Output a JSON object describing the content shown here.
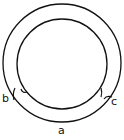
{
  "diagram": {
    "stroke_color": "#111111",
    "background": "#ffffff",
    "outer_circle": {
      "cx": 62,
      "cy": 63,
      "r": 59
    },
    "inner_circle": {
      "cx": 62,
      "cy": 64,
      "r": 45
    },
    "labels": {
      "a": "a",
      "b": "b",
      "c": "c"
    }
  }
}
